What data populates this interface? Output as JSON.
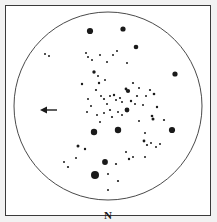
{
  "chart_data": {
    "type": "scatter",
    "title": "",
    "subtitle": "",
    "xlabel": "",
    "ylabel": "",
    "field_of_view": {
      "shape": "circle",
      "center_x": 108,
      "center_y": 106,
      "radius": 94,
      "stroke": "#4a4a4a",
      "stroke_width": 1,
      "fill": "none"
    },
    "axis_ranges": {
      "x": [
        0,
        217
      ],
      "y": [
        0,
        222
      ]
    },
    "grid": false,
    "legend": "none",
    "star_color": "#1a1a1a",
    "stars": [
      {
        "x": 90,
        "y": 31,
        "r": 3.1
      },
      {
        "x": 123,
        "y": 29,
        "r": 2.6
      },
      {
        "x": 136,
        "y": 47,
        "r": 2.3
      },
      {
        "x": 175,
        "y": 74,
        "r": 2.6
      },
      {
        "x": 94,
        "y": 132,
        "r": 3.2
      },
      {
        "x": 118,
        "y": 130,
        "r": 3.2
      },
      {
        "x": 172,
        "y": 130,
        "r": 3.1
      },
      {
        "x": 105,
        "y": 162,
        "r": 2.9
      },
      {
        "x": 95,
        "y": 175,
        "r": 4.0
      },
      {
        "x": 94,
        "y": 72,
        "r": 1.7
      },
      {
        "x": 128,
        "y": 91,
        "r": 2.1
      },
      {
        "x": 127,
        "y": 110,
        "r": 2.4
      },
      {
        "x": 126,
        "y": 89,
        "r": 1.4
      },
      {
        "x": 153,
        "y": 119,
        "r": 1.5
      },
      {
        "x": 144,
        "y": 141,
        "r": 1.4
      },
      {
        "x": 152,
        "y": 116,
        "r": 1.3
      },
      {
        "x": 78,
        "y": 146,
        "r": 1.5
      },
      {
        "x": 85,
        "y": 149,
        "r": 1.2
      },
      {
        "x": 68,
        "y": 167,
        "r": 1.1
      },
      {
        "x": 64,
        "y": 162,
        "r": 1.0
      },
      {
        "x": 118,
        "y": 181,
        "r": 1.1
      },
      {
        "x": 108,
        "y": 190,
        "r": 1.0
      },
      {
        "x": 96,
        "y": 90,
        "r": 1.1
      },
      {
        "x": 99,
        "y": 83,
        "r": 1.2
      },
      {
        "x": 101,
        "y": 96,
        "r": 1.0
      },
      {
        "x": 104,
        "y": 99,
        "r": 1.1
      },
      {
        "x": 110,
        "y": 96,
        "r": 1.0
      },
      {
        "x": 114,
        "y": 95,
        "r": 1.2
      },
      {
        "x": 116,
        "y": 100,
        "r": 1.0
      },
      {
        "x": 120,
        "y": 98,
        "r": 1.1
      },
      {
        "x": 122,
        "y": 102,
        "r": 1.0
      },
      {
        "x": 107,
        "y": 104,
        "r": 1.0
      },
      {
        "x": 110,
        "y": 110,
        "r": 1.1
      },
      {
        "x": 104,
        "y": 113,
        "r": 1.0
      },
      {
        "x": 112,
        "y": 117,
        "r": 1.1
      },
      {
        "x": 118,
        "y": 112,
        "r": 1.0
      },
      {
        "x": 122,
        "y": 115,
        "r": 1.0
      },
      {
        "x": 131,
        "y": 101,
        "r": 1.2
      },
      {
        "x": 135,
        "y": 104,
        "r": 1.0
      },
      {
        "x": 137,
        "y": 96,
        "r": 1.1
      },
      {
        "x": 133,
        "y": 83,
        "r": 1.1
      },
      {
        "x": 139,
        "y": 88,
        "r": 1.0
      },
      {
        "x": 88,
        "y": 99,
        "r": 1.0
      },
      {
        "x": 91,
        "y": 106,
        "r": 1.0
      },
      {
        "x": 87,
        "y": 112,
        "r": 1.0
      },
      {
        "x": 97,
        "y": 115,
        "r": 1.0
      },
      {
        "x": 100,
        "y": 122,
        "r": 1.0
      },
      {
        "x": 92,
        "y": 60,
        "r": 1.0
      },
      {
        "x": 100,
        "y": 55,
        "r": 1.0
      },
      {
        "x": 113,
        "y": 55,
        "r": 1.0
      },
      {
        "x": 117,
        "y": 51,
        "r": 1.0
      },
      {
        "x": 86,
        "y": 53,
        "r": 1.0
      },
      {
        "x": 45,
        "y": 54,
        "r": 1.0
      },
      {
        "x": 49,
        "y": 56,
        "r": 1.0
      },
      {
        "x": 88,
        "y": 57,
        "r": 1.0
      },
      {
        "x": 107,
        "y": 62,
        "r": 1.0
      },
      {
        "x": 127,
        "y": 63,
        "r": 1.0
      },
      {
        "x": 139,
        "y": 121,
        "r": 1.0
      },
      {
        "x": 147,
        "y": 145,
        "r": 1.1
      },
      {
        "x": 151,
        "y": 143,
        "r": 1.0
      },
      {
        "x": 156,
        "y": 147,
        "r": 1.0
      },
      {
        "x": 160,
        "y": 144,
        "r": 1.0
      },
      {
        "x": 129,
        "y": 159,
        "r": 1.2
      },
      {
        "x": 133,
        "y": 157,
        "r": 1.0
      },
      {
        "x": 126,
        "y": 152,
        "r": 1.0
      },
      {
        "x": 116,
        "y": 164,
        "r": 1.1
      },
      {
        "x": 157,
        "y": 107,
        "r": 1.2
      },
      {
        "x": 154,
        "y": 94,
        "r": 1.3
      },
      {
        "x": 150,
        "y": 90,
        "r": 1.1
      },
      {
        "x": 146,
        "y": 96,
        "r": 1.0
      },
      {
        "x": 143,
        "y": 105,
        "r": 1.0
      },
      {
        "x": 82,
        "y": 84,
        "r": 1.2
      },
      {
        "x": 98,
        "y": 76,
        "r": 1.0
      },
      {
        "x": 105,
        "y": 80,
        "r": 1.0
      },
      {
        "x": 145,
        "y": 133,
        "r": 1.0
      },
      {
        "x": 164,
        "y": 120,
        "r": 1.1
      },
      {
        "x": 76,
        "y": 158,
        "r": 1.0
      },
      {
        "x": 145,
        "y": 157,
        "r": 1.0
      },
      {
        "x": 108,
        "y": 174,
        "r": 1.0
      }
    ],
    "annotations": [
      {
        "name": "direction-arrow",
        "type": "arrow",
        "points_to": "left",
        "x_start": 57,
        "x_end": 40,
        "y": 110,
        "color": "#1a1a1a"
      },
      {
        "name": "north-indicator",
        "type": "text",
        "text": "N",
        "x": 108,
        "y": 210
      }
    ]
  },
  "labels": {
    "north": "N"
  },
  "colors": {
    "frame": "#3a3a3a",
    "circle": "#4a4a4a",
    "star": "#1a1a1a",
    "arrow": "#1a1a1a",
    "surround": "#f2f2f2",
    "panel": "#ffffff"
  }
}
